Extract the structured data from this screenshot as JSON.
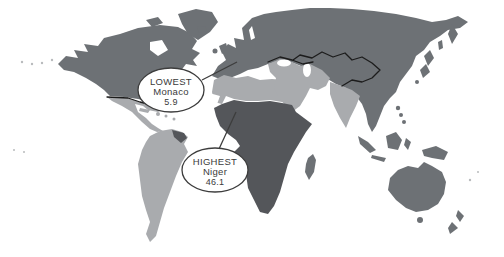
{
  "figure": {
    "type": "choropleth-world-map",
    "background": "#ffffff",
    "palette": {
      "light": "#a9abae",
      "medium": "#6d7175",
      "dark": "#54565a",
      "outline": "#1c1c1c",
      "callout_stroke": "#3d3d3d",
      "callout_fill": "#ffffff",
      "text": "#3a3a3a",
      "sea": "#ffffff"
    },
    "callouts": {
      "lowest": {
        "label": "LOWEST",
        "country": "Monaco",
        "value": "5.9"
      },
      "highest": {
        "label": "HIGHEST",
        "country": "Niger",
        "value": "46.1"
      }
    },
    "regions": [
      {
        "name": "North America",
        "shade": "medium"
      },
      {
        "name": "Greenland",
        "shade": "medium"
      },
      {
        "name": "Mexico & Central America",
        "shade": "light"
      },
      {
        "name": "Caribbean",
        "shade": "light"
      },
      {
        "name": "South America",
        "shade": "light"
      },
      {
        "name": "Guianas",
        "shade": "dark"
      },
      {
        "name": "Europe",
        "shade": "medium"
      },
      {
        "name": "Russia & East Asia",
        "shade": "medium"
      },
      {
        "name": "Middle East",
        "shade": "light"
      },
      {
        "name": "India",
        "shade": "light"
      },
      {
        "name": "North Africa",
        "shade": "light"
      },
      {
        "name": "Sub-Saharan Africa",
        "shade": "dark"
      },
      {
        "name": "Madagascar",
        "shade": "medium"
      },
      {
        "name": "Southeast Asia & Indonesia",
        "shade": "medium"
      },
      {
        "name": "Australia & New Zealand",
        "shade": "medium"
      }
    ]
  }
}
